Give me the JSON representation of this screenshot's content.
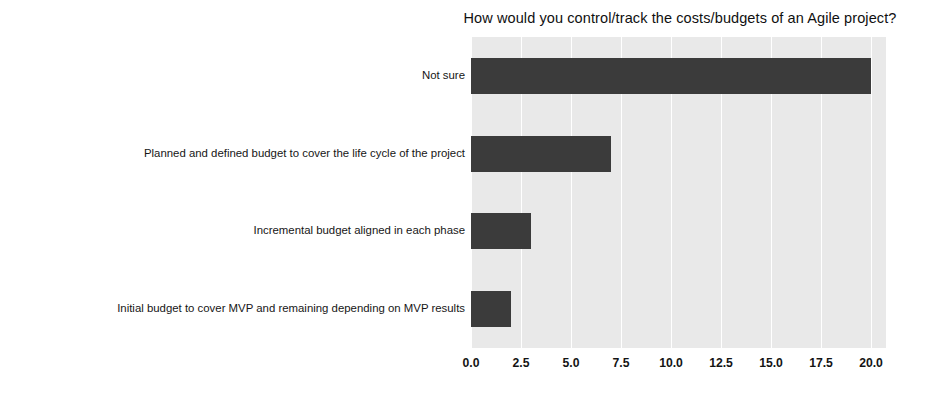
{
  "chart_data": {
    "type": "bar",
    "orientation": "horizontal",
    "title": "How would you control/track the costs/budgets of an Agile project?",
    "xlabel": "",
    "ylabel": "",
    "categories": [
      "Not sure",
      "Planned and defined budget to cover the life cycle of the project",
      "Incremental budget aligned in each phase",
      "Initial budget to cover MVP and remaining depending on MVP results"
    ],
    "values": [
      20,
      7,
      3,
      2
    ],
    "xlim": [
      0,
      20.75
    ],
    "xticks": [
      "0.0",
      "2.5",
      "5.0",
      "7.5",
      "10.0",
      "12.5",
      "15.0",
      "17.5",
      "20.0"
    ],
    "xtick_values": [
      0,
      2.5,
      5,
      7.5,
      10,
      12.5,
      15,
      17.5,
      20
    ],
    "grid": "vertical-white",
    "legend": "none",
    "bar_color": "#3b3b3b",
    "plot_background": "#e9e9e9",
    "figure_background": "#ffffff"
  }
}
